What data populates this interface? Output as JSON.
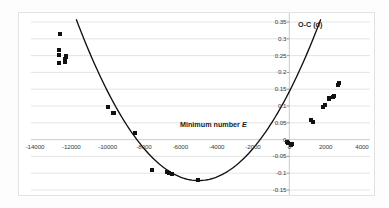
{
  "chart_data": {
    "type": "scatter",
    "title": "",
    "xlabel": "Minimum number E",
    "ylabel": "O-C (d)",
    "xlim": [
      -15000,
      4500
    ],
    "ylim": [
      -0.15,
      0.35
    ],
    "grid": true,
    "legend": false,
    "xticks": [
      -14000,
      -12000,
      -10000,
      -8000,
      -6000,
      -4000,
      -2000,
      0,
      2000,
      4000
    ],
    "xtick_labels": [
      "-14000",
      "-12000",
      "-10000",
      "-8000",
      "-6000",
      "-4000",
      "-2000",
      "0",
      "2000",
      "4000"
    ],
    "yticks": [
      0.35,
      0.3,
      0.25,
      0.2,
      0.15,
      0.1,
      0.05,
      0,
      -0.05,
      -0.1,
      -0.15
    ],
    "ytick_labels": [
      "0.35",
      "0.3",
      "0.25",
      "0.2",
      "0.15",
      "0.1",
      "0.05",
      "0",
      "-0.05",
      "-0.1",
      "-0.15"
    ],
    "series": [
      {
        "name": "observations",
        "marker": "square",
        "color": "#111111",
        "points": [
          {
            "x": -12620,
            "y": 0.315
          },
          {
            "x": -12700,
            "y": 0.268
          },
          {
            "x": -12700,
            "y": 0.252
          },
          {
            "x": -12690,
            "y": 0.228
          },
          {
            "x": -12300,
            "y": 0.25
          },
          {
            "x": -12280,
            "y": 0.245
          },
          {
            "x": -12340,
            "y": 0.24
          },
          {
            "x": -12360,
            "y": 0.232
          },
          {
            "x": -9960,
            "y": 0.098
          },
          {
            "x": -9720,
            "y": 0.08
          },
          {
            "x": -9640,
            "y": 0.078
          },
          {
            "x": -8520,
            "y": 0.02
          },
          {
            "x": -7540,
            "y": -0.09
          },
          {
            "x": -6760,
            "y": -0.096
          },
          {
            "x": -6620,
            "y": -0.098
          },
          {
            "x": -6480,
            "y": -0.102
          },
          {
            "x": -5020,
            "y": -0.119
          },
          {
            "x": -140,
            "y": -0.008
          },
          {
            "x": -60,
            "y": -0.011
          },
          {
            "x": 90,
            "y": -0.015
          },
          {
            "x": 150,
            "y": -0.012
          },
          {
            "x": 1180,
            "y": 0.058
          },
          {
            "x": 1320,
            "y": 0.052
          },
          {
            "x": 1860,
            "y": 0.098
          },
          {
            "x": 1940,
            "y": 0.103
          },
          {
            "x": 2160,
            "y": 0.12
          },
          {
            "x": 2210,
            "y": 0.124
          },
          {
            "x": 2420,
            "y": 0.128
          },
          {
            "x": 2480,
            "y": 0.13
          },
          {
            "x": 2700,
            "y": 0.162
          },
          {
            "x": 2740,
            "y": 0.168
          }
        ]
      }
    ],
    "fit_curve": {
      "name": "quadratic-fit",
      "type": "parabola",
      "vertex_x": -5000,
      "vertex_y": -0.122,
      "curvature": 1.06e-08,
      "color": "#111111"
    }
  },
  "axes": {
    "y_axis_line_at_x": 0,
    "x_axis_line_at_y": 0
  }
}
